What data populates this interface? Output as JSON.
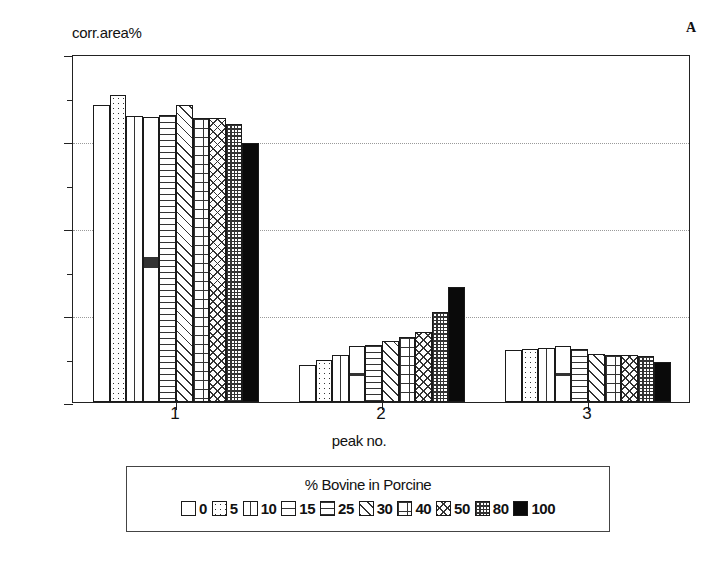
{
  "panel_letter": "A",
  "chart_data": {
    "type": "bar",
    "title": "",
    "ylabel": "corr.area%",
    "xlabel": "peak no.",
    "categories": [
      "1",
      "2",
      "3"
    ],
    "ylim": [
      0,
      80
    ],
    "yticks": [
      0,
      20,
      40,
      60,
      80
    ],
    "ytick_labels": [
      "0",
      "20",
      "40",
      "60",
      "80"
    ],
    "yminor_ticks": [
      10,
      30,
      50,
      70
    ],
    "grid": true,
    "grid_axis": "y",
    "legend_position": "bottom",
    "legend_title": "% Bovine in Porcine",
    "series": [
      {
        "name": "0",
        "pattern": "empty",
        "values": [
          68.2,
          8.6,
          12.0
        ]
      },
      {
        "name": "5",
        "pattern": "dots",
        "values": [
          70.5,
          9.7,
          12.1
        ]
      },
      {
        "name": "10",
        "pattern": "vert2",
        "values": [
          65.8,
          10.8,
          12.4
        ]
      },
      {
        "name": "15",
        "pattern": "horiz1",
        "values": [
          65.6,
          12.8,
          12.8
        ]
      },
      {
        "name": "25",
        "pattern": "horiz",
        "values": [
          66.0,
          13.2,
          12.2
        ]
      },
      {
        "name": "30",
        "pattern": "diag",
        "values": [
          68.2,
          14.0,
          11.0
        ]
      },
      {
        "name": "40",
        "pattern": "grid",
        "values": [
          65.4,
          15.0,
          10.8
        ]
      },
      {
        "name": "50",
        "pattern": "xhatch",
        "values": [
          65.2,
          16.0,
          10.8
        ]
      },
      {
        "name": "80",
        "pattern": "densegrid",
        "values": [
          64.0,
          20.7,
          10.6
        ]
      },
      {
        "name": "100",
        "pattern": "solid",
        "values": [
          59.6,
          26.5,
          9.2
        ]
      }
    ]
  }
}
